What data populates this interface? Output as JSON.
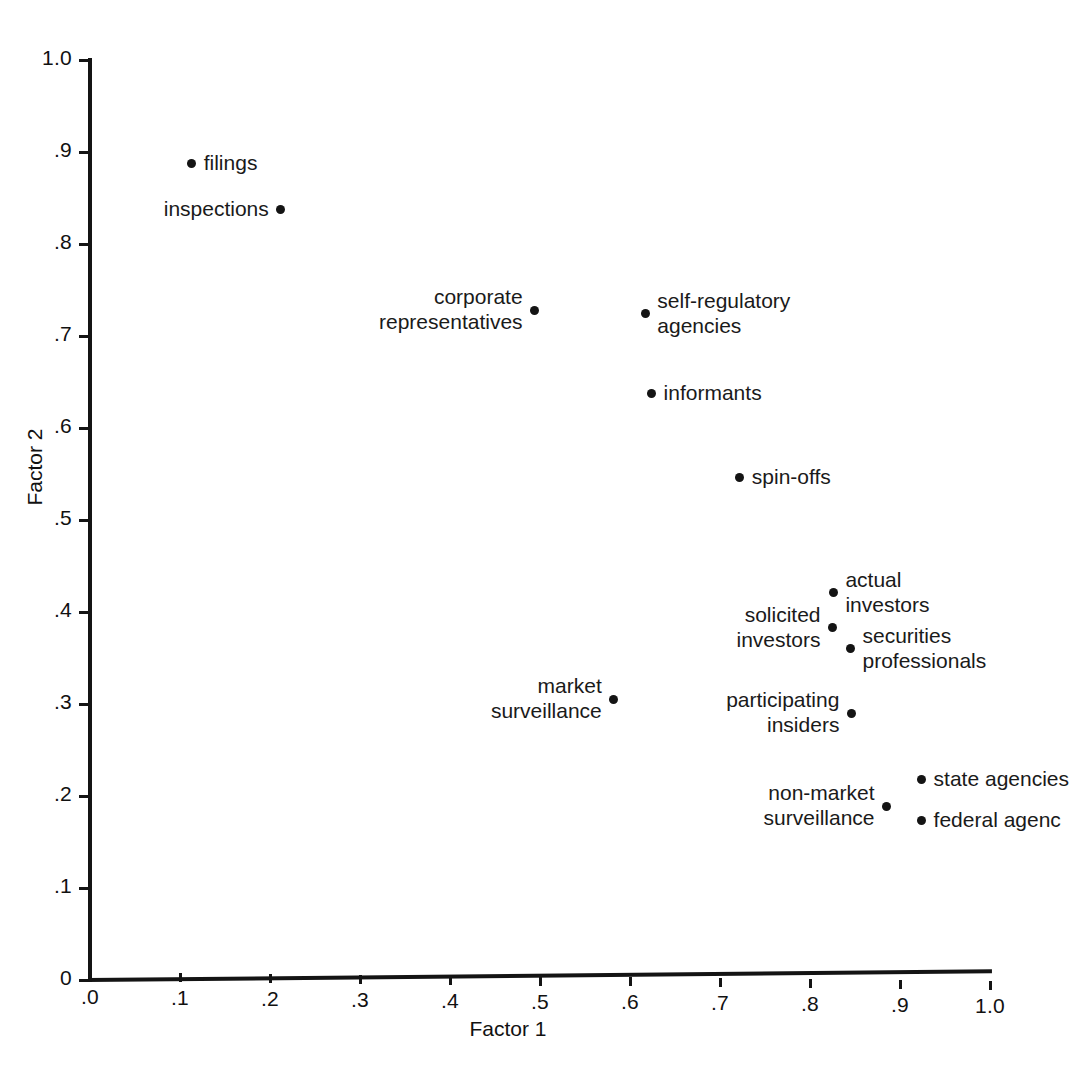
{
  "chart_data": {
    "type": "scatter",
    "title": "",
    "xlabel": "Factor 1",
    "ylabel": "Factor 2",
    "xlim": [
      0.0,
      1.0
    ],
    "ylim": [
      0.0,
      1.0
    ],
    "grid": false,
    "legend": "none",
    "xticks": [
      ".0",
      ".1",
      ".2",
      ".3",
      ".4",
      ".5",
      ".6",
      ".7",
      ".8",
      ".9",
      "1.0"
    ],
    "xtick_values": [
      0.0,
      0.1,
      0.2,
      0.3,
      0.4,
      0.5,
      0.6,
      0.7,
      0.8,
      0.9,
      1.0
    ],
    "yticks": [
      "1.0",
      ".9",
      ".8",
      ".7",
      ".6",
      ".5",
      ".4",
      ".3",
      ".2",
      ".1",
      "0"
    ],
    "ytick_values": [
      1.0,
      0.9,
      0.8,
      0.7,
      0.6,
      0.5,
      0.4,
      0.3,
      0.2,
      0.1,
      0.0
    ],
    "points": [
      {
        "label": "filings",
        "x": 0.113,
        "y": 0.887,
        "side": "right",
        "lines": [
          "filings"
        ]
      },
      {
        "label": "inspections",
        "x": 0.212,
        "y": 0.838,
        "side": "left",
        "lines": [
          "inspections"
        ]
      },
      {
        "label": "corporate representatives",
        "x": 0.494,
        "y": 0.728,
        "side": "left",
        "lines": [
          "corporate",
          "representatives"
        ]
      },
      {
        "label": "self-regulatory agencies",
        "x": 0.617,
        "y": 0.724,
        "side": "right",
        "lines": [
          "self-regulatory",
          "agencies"
        ]
      },
      {
        "label": "informants",
        "x": 0.624,
        "y": 0.637,
        "side": "right",
        "lines": [
          "informants"
        ]
      },
      {
        "label": "spin-offs",
        "x": 0.722,
        "y": 0.546,
        "side": "right",
        "lines": [
          "spin-offs"
        ]
      },
      {
        "label": "actual investors",
        "x": 0.826,
        "y": 0.421,
        "side": "right",
        "lines": [
          "actual",
          "investors"
        ]
      },
      {
        "label": "solicited investors",
        "x": 0.825,
        "y": 0.383,
        "side": "left",
        "lines": [
          "solicited",
          "investors"
        ]
      },
      {
        "label": "securities professionals",
        "x": 0.845,
        "y": 0.36,
        "side": "right",
        "lines": [
          "securities",
          "professionals"
        ]
      },
      {
        "label": "market surveillance",
        "x": 0.582,
        "y": 0.305,
        "side": "left",
        "lines": [
          "market",
          "surveillance"
        ]
      },
      {
        "label": "participating insiders",
        "x": 0.846,
        "y": 0.29,
        "side": "left",
        "lines": [
          "participating",
          "insiders"
        ]
      },
      {
        "label": "state agencies",
        "x": 0.924,
        "y": 0.218,
        "side": "right",
        "lines": [
          "state agencies"
        ]
      },
      {
        "label": "non-market surveillance",
        "x": 0.885,
        "y": 0.189,
        "side": "left",
        "lines": [
          "non-market",
          "surveillance"
        ]
      },
      {
        "label": "federal agencies",
        "x": 0.924,
        "y": 0.173,
        "side": "right",
        "lines": [
          "federal agenc"
        ]
      }
    ]
  },
  "axes": {
    "x_title": "Factor 1",
    "y_title": "Factor 2"
  },
  "caption": ""
}
